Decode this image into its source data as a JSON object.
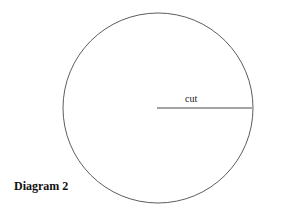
{
  "diagram": {
    "title": "Diagram 2",
    "shapes": {
      "circle": {
        "cx": 158,
        "cy": 108,
        "r": 95,
        "stroke": "#333333"
      },
      "cut_line": {
        "x1": 157,
        "y1": 108,
        "x2": 252,
        "y2": 108,
        "label": "cut"
      }
    }
  }
}
